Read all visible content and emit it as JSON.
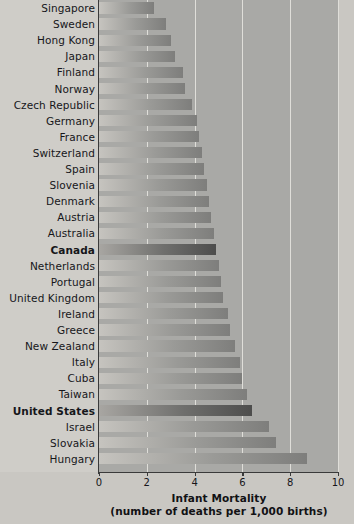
{
  "chart_data": {
    "type": "bar",
    "orientation": "horizontal",
    "title": "",
    "xlabel": "Infant Mortality",
    "xlabel_sub": "(number of deaths per 1,000 births)",
    "ylabel": "",
    "xlim": [
      0,
      10
    ],
    "xticks": [
      0,
      2,
      4,
      6,
      8,
      10
    ],
    "xtick_labels": [
      "0",
      "2",
      "4",
      "6",
      "8",
      "10"
    ],
    "grid": true,
    "grid_axis": "x",
    "legend": false,
    "units": "deaths per 1,000 births",
    "sort": "ascending",
    "highlight_color": "#4d4d4c",
    "bar_color": "#9a9a97",
    "background_color": "#a9a9a6",
    "label_gutter_color": "#cfcdc8",
    "gridline_color": "#e9e7e2",
    "axis_color": "#3a3a3a",
    "categories": [
      "Singapore",
      "Sweden",
      "Hong Kong",
      "Japan",
      "Finland",
      "Norway",
      "Czech Republic",
      "Germany",
      "France",
      "Switzerland",
      "Spain",
      "Slovenia",
      "Denmark",
      "Austria",
      "Australia",
      "Canada",
      "Netherlands",
      "Portugal",
      "United Kingdom",
      "Ireland",
      "Greece",
      "New Zealand",
      "Italy",
      "Cuba",
      "Taiwan",
      "United States",
      "Israel",
      "Slovakia",
      "Hungary"
    ],
    "values": [
      2.3,
      2.8,
      3.0,
      3.2,
      3.5,
      3.6,
      3.9,
      4.1,
      4.2,
      4.3,
      4.4,
      4.5,
      4.6,
      4.7,
      4.8,
      4.9,
      5.0,
      5.1,
      5.2,
      5.4,
      5.5,
      5.7,
      5.9,
      6.0,
      6.2,
      6.4,
      7.1,
      7.4,
      8.7
    ],
    "highlighted": [
      "Canada",
      "United States"
    ]
  },
  "axis": {
    "title_line1": "Infant Mortality",
    "title_line2": "(number of deaths per 1,000 births)"
  }
}
